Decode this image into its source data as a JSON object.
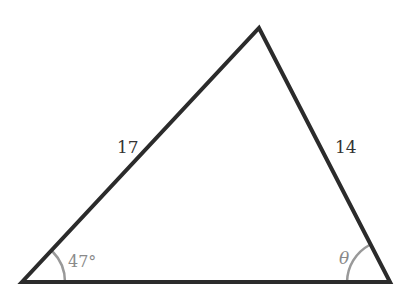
{
  "diagram": {
    "type": "triangle",
    "vertices": {
      "left": [
        22,
        282
      ],
      "right": [
        390,
        282
      ],
      "top": [
        259,
        28
      ]
    },
    "sides": {
      "left_side": {
        "label": "17",
        "from": "left",
        "to": "top"
      },
      "right_side": {
        "label": "14",
        "from": "right",
        "to": "top"
      },
      "base": {
        "label": ""
      }
    },
    "angles": {
      "left": {
        "label": "47°",
        "vertex": "left"
      },
      "right": {
        "label": "θ",
        "vertex": "right"
      }
    },
    "colors": {
      "stroke": "#2b2b2b",
      "arc": "#999999",
      "angle_text": "#8a8a8a",
      "side_text": "#333333"
    }
  }
}
